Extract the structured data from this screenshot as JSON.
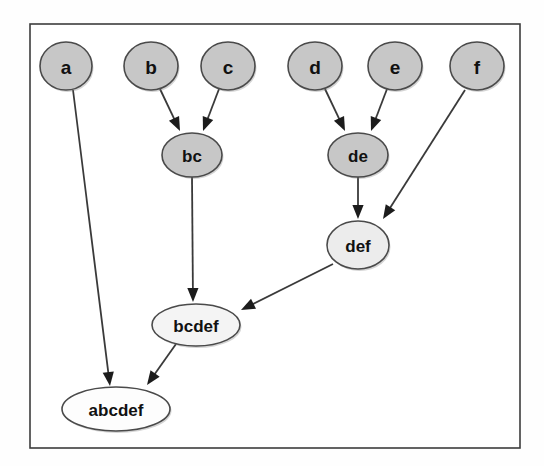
{
  "figure": {
    "background_color": "#ffffff",
    "frame": {
      "x": 30,
      "y": 24,
      "width": 490,
      "height": 424,
      "border_color": "#3d3d3d",
      "fill_color": "#ffffff"
    }
  },
  "palette": {
    "leaf_fill": "#c7c7c7",
    "merge_fill": "#c7c7c7",
    "upper_fill": "#ececec",
    "root_fill": "#fdfdfd",
    "node_stroke": "#4a4a4a",
    "edge_stroke": "#3a3a3a",
    "label_color": "#111111"
  },
  "graph": {
    "type": "directed-acyclic-graph",
    "direction": "top-to-bottom",
    "node_count": 10,
    "edge_count": 9,
    "nodes": [
      {
        "id": "a",
        "label": "a",
        "cx": 66,
        "cy": 66,
        "rx": 26,
        "ry": 24,
        "fill": "#c7c7c7",
        "font_size": 19,
        "level": 0
      },
      {
        "id": "b",
        "label": "b",
        "cx": 151,
        "cy": 66,
        "rx": 27,
        "ry": 24,
        "fill": "#c7c7c7",
        "font_size": 19,
        "level": 0
      },
      {
        "id": "c",
        "label": "c",
        "cx": 228,
        "cy": 66,
        "rx": 27,
        "ry": 24,
        "fill": "#c7c7c7",
        "font_size": 19,
        "level": 0
      },
      {
        "id": "d",
        "label": "d",
        "cx": 315,
        "cy": 66,
        "rx": 27,
        "ry": 24,
        "fill": "#c7c7c7",
        "font_size": 19,
        "level": 0
      },
      {
        "id": "e",
        "label": "e",
        "cx": 395,
        "cy": 66,
        "rx": 27,
        "ry": 24,
        "fill": "#c7c7c7",
        "font_size": 19,
        "level": 0
      },
      {
        "id": "f",
        "label": "f",
        "cx": 477,
        "cy": 66,
        "rx": 27,
        "ry": 24,
        "fill": "#c7c7c7",
        "font_size": 19,
        "level": 0
      },
      {
        "id": "bc",
        "label": "bc",
        "cx": 192,
        "cy": 155,
        "rx": 30,
        "ry": 22,
        "fill": "#c7c7c7",
        "font_size": 17,
        "level": 1
      },
      {
        "id": "de",
        "label": "de",
        "cx": 358,
        "cy": 155,
        "rx": 30,
        "ry": 22,
        "fill": "#c7c7c7",
        "font_size": 17,
        "level": 1
      },
      {
        "id": "def",
        "label": "def",
        "cx": 358,
        "cy": 245,
        "rx": 31,
        "ry": 24,
        "fill": "#ececec",
        "font_size": 17,
        "level": 2
      },
      {
        "id": "bcdef",
        "label": "bcdef",
        "cx": 196,
        "cy": 325,
        "rx": 44,
        "ry": 21,
        "fill": "#f4f4f4",
        "font_size": 17,
        "level": 3
      },
      {
        "id": "abcdef",
        "label": "abcdef",
        "cx": 116,
        "cy": 409,
        "rx": 54,
        "ry": 22,
        "fill": "#fdfdfd",
        "font_size": 17,
        "level": 4
      }
    ],
    "edges": [
      {
        "id": "edge-a-abcdef",
        "from": "a",
        "to": "abcdef",
        "x1": 73,
        "y1": 90,
        "x2": 110,
        "y2": 386
      },
      {
        "id": "edge-b-bc",
        "from": "b",
        "to": "bc",
        "x1": 160,
        "y1": 89,
        "x2": 180,
        "y2": 131
      },
      {
        "id": "edge-c-bc",
        "from": "c",
        "to": "bc",
        "x1": 219,
        "y1": 89,
        "x2": 203,
        "y2": 131
      },
      {
        "id": "edge-d-de",
        "from": "d",
        "to": "de",
        "x1": 325,
        "y1": 89,
        "x2": 345,
        "y2": 131
      },
      {
        "id": "edge-e-de",
        "from": "e",
        "to": "de",
        "x1": 387,
        "y1": 89,
        "x2": 371,
        "y2": 131
      },
      {
        "id": "edge-bc-bcdef",
        "from": "bc",
        "to": "bcdef",
        "x1": 192,
        "y1": 177,
        "x2": 193,
        "y2": 302
      },
      {
        "id": "edge-de-def",
        "from": "de",
        "to": "def",
        "x1": 358,
        "y1": 177,
        "x2": 358,
        "y2": 219
      },
      {
        "id": "edge-f-def",
        "from": "f",
        "to": "def",
        "x1": 465,
        "y1": 90,
        "x2": 383,
        "y2": 219
      },
      {
        "id": "edge-def-bcdef",
        "from": "def",
        "to": "bcdef",
        "x1": 333,
        "y1": 264,
        "x2": 241,
        "y2": 310
      },
      {
        "id": "edge-bcdef-abcdef",
        "from": "bcdef",
        "to": "abcdef",
        "x1": 176,
        "y1": 344,
        "x2": 147,
        "y2": 385
      }
    ]
  }
}
